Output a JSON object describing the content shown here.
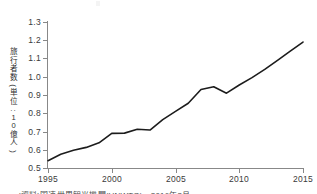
{
  "chart_data": {
    "type": "line",
    "title": "",
    "xlabel": "",
    "ylabel": "旅行者数(単位:10億人)",
    "xlim": [
      1995,
      2015
    ],
    "ylim": [
      0.5,
      1.3
    ],
    "xticks": [
      1995,
      2000,
      2005,
      2010,
      2015
    ],
    "yticks": [
      0.5,
      0.6,
      0.7,
      0.8,
      0.9,
      1.0,
      1.1,
      1.2,
      1.3
    ],
    "ytick_labels": [
      "0.5",
      "0.6",
      "0.7",
      "0.8",
      "0.9",
      "1.0",
      "1.1",
      "1.2",
      "1.3"
    ],
    "xtick_labels": [
      "1995",
      "2000",
      "2005",
      "2010",
      "2015"
    ],
    "grid": false,
    "legend": false,
    "series": [
      {
        "name": "旅行者数",
        "color": "#1c1c1c",
        "x": [
          1995,
          1996,
          1997,
          1998,
          1999,
          2000,
          2001,
          2002,
          2003,
          2004,
          2005,
          2006,
          2007,
          2008,
          2009,
          2010,
          2011,
          2012,
          2013,
          2014,
          2015
        ],
        "values": [
          0.54,
          0.575,
          0.597,
          0.613,
          0.638,
          0.69,
          0.691,
          0.712,
          0.708,
          0.765,
          0.81,
          0.855,
          0.93,
          0.945,
          0.91,
          0.955,
          0.995,
          1.04,
          1.09,
          1.14,
          1.19
        ]
      }
    ]
  },
  "axes": {
    "y_title": "旅行者数(単位:10億人)",
    "y_title_chars": [
      "旅",
      "行",
      "者",
      "数",
      "(",
      "単",
      "位",
      ":",
      "1",
      "0",
      "億",
      "人",
      ")"
    ]
  },
  "caption": {
    "text": "(資料)国連世界観光機関(UNWTO)、2016年3月"
  }
}
